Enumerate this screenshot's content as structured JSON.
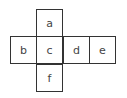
{
  "diagram": {
    "type": "cube-net",
    "faces": [
      {
        "label": "a",
        "row": 0,
        "col": 1
      },
      {
        "label": "b",
        "row": 1,
        "col": 0
      },
      {
        "label": "c",
        "row": 1,
        "col": 1
      },
      {
        "label": "d",
        "row": 1,
        "col": 2
      },
      {
        "label": "e",
        "row": 1,
        "col": 3
      },
      {
        "label": "f",
        "row": 2,
        "col": 1
      }
    ],
    "stroke_color": "#333333",
    "text_color": "#444444"
  }
}
